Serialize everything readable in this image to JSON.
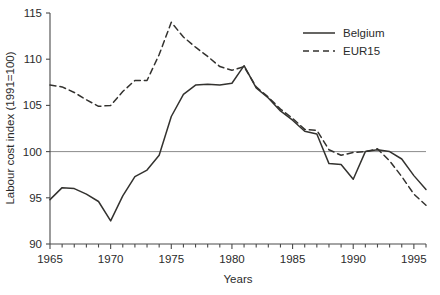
{
  "chart_data": {
    "type": "line",
    "title": "",
    "xlabel": "Years",
    "ylabel": "Labour cost index (1991=100)",
    "xlim": [
      1965,
      1996
    ],
    "ylim": [
      90,
      115
    ],
    "yticks": [
      90,
      95,
      100,
      105,
      110,
      115
    ],
    "xticks_labeled": [
      1965,
      1970,
      1975,
      1980,
      1985,
      1990,
      1995
    ],
    "xtick_step": 1,
    "grid": false,
    "reference_line": 100,
    "legend_position": "top-right",
    "series": [
      {
        "name": "Belgium",
        "style": "solid",
        "color": "#33322f",
        "x": [
          1965,
          1966,
          1967,
          1968,
          1969,
          1970,
          1971,
          1972,
          1973,
          1974,
          1975,
          1976,
          1977,
          1978,
          1979,
          1980,
          1981,
          1982,
          1983,
          1984,
          1985,
          1986,
          1987,
          1988,
          1989,
          1990,
          1991,
          1992,
          1993,
          1994,
          1995,
          1996
        ],
        "values": [
          94.8,
          96.1,
          96.0,
          95.4,
          94.6,
          92.5,
          95.2,
          97.3,
          98.0,
          99.6,
          103.8,
          106.2,
          107.2,
          107.3,
          107.2,
          107.4,
          109.3,
          106.9,
          105.8,
          104.4,
          103.4,
          102.2,
          101.9,
          98.7,
          98.6,
          97.0,
          100.0,
          100.2,
          100.0,
          99.2,
          97.4,
          95.9
        ]
      },
      {
        "name": "EUR15",
        "style": "dashed",
        "color": "#33322f",
        "x": [
          1965,
          1966,
          1967,
          1968,
          1969,
          1970,
          1971,
          1972,
          1973,
          1974,
          1975,
          1976,
          1977,
          1978,
          1979,
          1980,
          1981,
          1982,
          1983,
          1984,
          1985,
          1986,
          1987,
          1988,
          1989,
          1990,
          1991,
          1992,
          1993,
          1994,
          1995,
          1996
        ],
        "values": [
          107.2,
          107.0,
          106.4,
          105.6,
          104.9,
          105.0,
          106.5,
          107.7,
          107.7,
          110.5,
          114.0,
          112.4,
          111.3,
          110.3,
          109.2,
          108.8,
          109.2,
          107.0,
          105.9,
          104.6,
          103.6,
          102.4,
          102.3,
          100.2,
          99.6,
          99.9,
          100.0,
          100.3,
          99.0,
          97.3,
          95.4,
          94.2
        ]
      }
    ],
    "legend": [
      {
        "label": "Belgium",
        "style": "solid"
      },
      {
        "label": "EUR15",
        "style": "dashed"
      }
    ]
  }
}
